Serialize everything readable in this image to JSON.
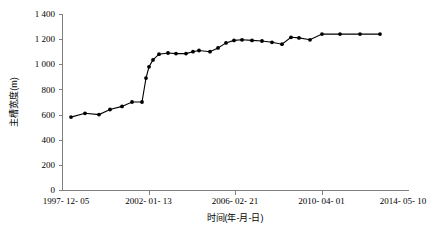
{
  "chart_data": {
    "type": "line",
    "title": "",
    "subtitle": "",
    "xlabel": "时间(年-月-日)",
    "ylabel": "主槽宽度(m)",
    "xlim": [
      "1997-12-05",
      "2014-05-10"
    ],
    "ylim": [
      0,
      1400
    ],
    "y_ticks": [
      0,
      200,
      400,
      600,
      800,
      1000,
      1200,
      1400
    ],
    "y_tick_labels": [
      "0",
      "200",
      "400",
      "600",
      "800",
      "1 000",
      "1 200",
      "1 400"
    ],
    "x_ticks": [
      "1997-12-05",
      "2002-01-13",
      "2006-02-21",
      "2010-04-01",
      "2014-05-10"
    ],
    "x_tick_labels": [
      "1997- 12- 05",
      "2002- 01- 13",
      "2006- 02- 21",
      "2010- 04- 01",
      "2014- 05- 10"
    ],
    "grid": false,
    "legend": false,
    "legend_position": "none",
    "marker": "filled-circle",
    "line_color": "#000000",
    "marker_color": "#000000",
    "axis_color": "#808080",
    "background_color": "#ffffff",
    "series": [
      {
        "name": "主槽宽度",
        "x": [
          "1998-07-20",
          "1999-10-15",
          "2000-06-10",
          "2001-04-05",
          "2001-11-20",
          "2002-07-15",
          "2003-03-10",
          "2003-09-05",
          "2004-01-20",
          "2004-05-15",
          "2004-10-10",
          "2005-04-05",
          "2005-09-20",
          "2006-04-15",
          "2006-10-10",
          "2007-03-05",
          "2007-08-20",
          "2008-02-15",
          "2008-08-10",
          "2009-02-05",
          "2009-08-20",
          "2010-02-15",
          "2010-08-10",
          "2011-02-05",
          "2011-08-20",
          "2012-02-15",
          "2012-08-10",
          "2013-01-05",
          "2013-05-20",
          "2013-09-15",
          "2014-01-10",
          "2014-05-10"
        ],
        "y": [
          580,
          610,
          600,
          640,
          665,
          700,
          700,
          890,
          980,
          1035,
          1080,
          1090,
          1085,
          1085,
          1100,
          1110,
          1100,
          1130,
          1170,
          1190,
          1195,
          1190,
          1185,
          1175,
          1160,
          1215,
          1210,
          1195,
          1240,
          1240,
          1240,
          1240
        ],
        "x_pixels": [
          71,
          85,
          99,
          110,
          122,
          132,
          142,
          146,
          149,
          153,
          159,
          168,
          176,
          186,
          193,
          199,
          210,
          218,
          226,
          234,
          242,
          252,
          262,
          272,
          282,
          291,
          299,
          310,
          322,
          340,
          360,
          380
        ]
      }
    ]
  },
  "plot_geometry": {
    "left": 62,
    "right": 408,
    "top": 14,
    "bottom": 190,
    "y_min": 0,
    "y_max": 1400
  }
}
